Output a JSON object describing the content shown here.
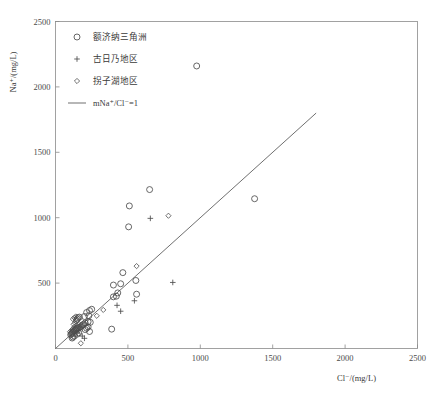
{
  "chart_data": {
    "type": "scatter",
    "title": "",
    "xlabel": "Cl⁻/(mg/L)",
    "ylabel": "Na⁺/(mg/L)",
    "xlim": [
      0,
      2500
    ],
    "ylim": [
      0,
      2500
    ],
    "xticks": [
      0,
      500,
      1000,
      1500,
      2000,
      2500
    ],
    "yticks": [
      0,
      500,
      1000,
      1500,
      2000,
      2500
    ],
    "grid": false,
    "legend_position": "top-left",
    "series": [
      {
        "name": "额济纳三角洲",
        "marker": "circle",
        "points": [
          [
            975,
            2160
          ],
          [
            650,
            1215
          ],
          [
            510,
            1090
          ],
          [
            505,
            930
          ],
          [
            1375,
            1145
          ],
          [
            465,
            580
          ],
          [
            555,
            520
          ],
          [
            450,
            495
          ],
          [
            400,
            485
          ],
          [
            560,
            415
          ],
          [
            430,
            425
          ],
          [
            420,
            400
          ],
          [
            400,
            395
          ],
          [
            250,
            300
          ],
          [
            235,
            290
          ],
          [
            215,
            275
          ],
          [
            230,
            250
          ],
          [
            200,
            245
          ],
          [
            165,
            240
          ],
          [
            155,
            235
          ],
          [
            150,
            225
          ],
          [
            145,
            215
          ],
          [
            225,
            205
          ],
          [
            240,
            200
          ],
          [
            205,
            195
          ],
          [
            195,
            185
          ],
          [
            185,
            180
          ],
          [
            180,
            170
          ],
          [
            170,
            165
          ],
          [
            160,
            160
          ],
          [
            150,
            155
          ],
          [
            145,
            150
          ],
          [
            140,
            145
          ],
          [
            135,
            140
          ],
          [
            130,
            135
          ],
          [
            125,
            130
          ],
          [
            120,
            125
          ],
          [
            115,
            118
          ],
          [
            110,
            112
          ],
          [
            105,
            105
          ],
          [
            225,
            165
          ],
          [
            215,
            155
          ],
          [
            205,
            145
          ],
          [
            160,
            120
          ],
          [
            150,
            110
          ],
          [
            388,
            148
          ],
          [
            235,
            130
          ],
          [
            130,
            95
          ],
          [
            120,
            88
          ],
          [
            115,
            80
          ]
        ]
      },
      {
        "name": "古日乃地区",
        "marker": "plus",
        "points": [
          [
            655,
            995
          ],
          [
            810,
            505
          ],
          [
            545,
            365
          ],
          [
            425,
            330
          ],
          [
            450,
            285
          ],
          [
            175,
            165
          ],
          [
            160,
            135
          ],
          [
            150,
            118
          ],
          [
            185,
            95
          ],
          [
            200,
            78
          ]
        ]
      },
      {
        "name": "拐子湖地区",
        "marker": "diamond",
        "points": [
          [
            780,
            1015
          ],
          [
            560,
            630
          ],
          [
            330,
            295
          ],
          [
            285,
            250
          ],
          [
            140,
            245
          ],
          [
            130,
            235
          ],
          [
            120,
            225
          ],
          [
            150,
            215
          ],
          [
            135,
            195
          ],
          [
            125,
            185
          ],
          [
            145,
            175
          ],
          [
            130,
            165
          ],
          [
            120,
            150
          ],
          [
            110,
            138
          ],
          [
            100,
            128
          ],
          [
            175,
            40
          ]
        ]
      }
    ],
    "reference_line": {
      "label": "mNa⁺/Cl⁻=1",
      "from": [
        0,
        0
      ],
      "to": [
        1800,
        1800
      ],
      "slope": 1,
      "intercept": 0
    }
  },
  "axes": {
    "x_title": "Cl⁻/(mg/L)",
    "y_title": "Na⁺/(mg/L)",
    "x_tick_labels": [
      "0",
      "500",
      "1000",
      "1500",
      "2000",
      "2500"
    ],
    "y_tick_labels": [
      "0",
      "500",
      "1000",
      "1500",
      "2000",
      "2500"
    ]
  },
  "legend": {
    "items": [
      {
        "marker": "circle",
        "label": "额济纳三角洲"
      },
      {
        "marker": "plus",
        "label": "古日乃地区"
      },
      {
        "marker": "diamond",
        "label": "拐子湖地区"
      },
      {
        "marker": "line",
        "label": "mNa⁺/Cl⁻=1"
      }
    ]
  },
  "colors": {
    "marker_stroke": "#4d4d4d",
    "frame": "#8a8a8a",
    "reference_line": "#555555",
    "text": "#3a3a3a",
    "background": "#ffffff"
  }
}
